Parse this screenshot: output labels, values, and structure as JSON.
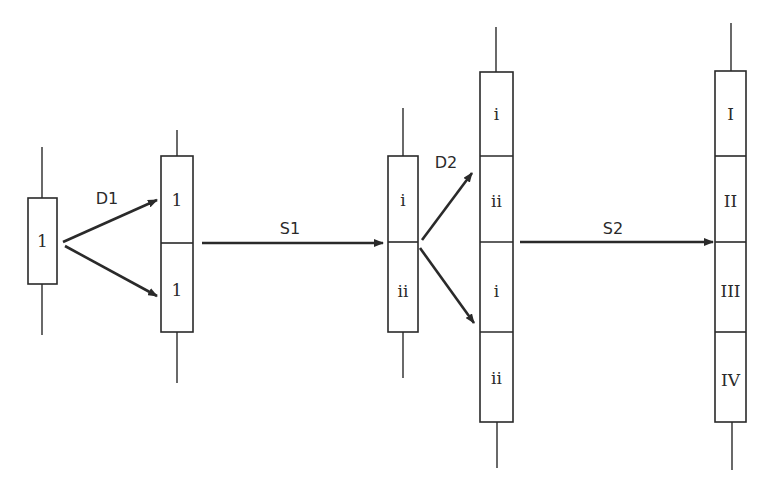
{
  "diagram": {
    "colors": {
      "stroke": "#2a2a2a",
      "background": "#ffffff"
    },
    "stages": [
      {
        "id": "stage-1",
        "segments": [
          "1"
        ]
      },
      {
        "id": "stage-2",
        "segments": [
          "1",
          "1"
        ]
      },
      {
        "id": "stage-3",
        "segments": [
          "i",
          "ii"
        ]
      },
      {
        "id": "stage-4",
        "segments": [
          "i",
          "ii",
          "i",
          "ii"
        ]
      },
      {
        "id": "stage-5",
        "segments": [
          "I",
          "II",
          "III",
          "IV"
        ]
      }
    ],
    "steps": [
      {
        "id": "D1",
        "label": "D1",
        "type": "branching"
      },
      {
        "id": "S1",
        "label": "S1",
        "type": "straight"
      },
      {
        "id": "D2",
        "label": "D2",
        "type": "branching"
      },
      {
        "id": "S2",
        "label": "S2",
        "type": "straight"
      }
    ]
  }
}
